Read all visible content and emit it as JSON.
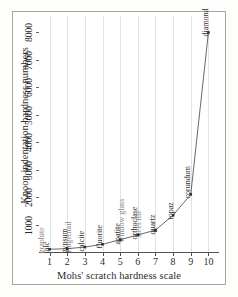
{
  "chart_data": {
    "type": "line",
    "title": "",
    "xlabel": "Mohs' scratch hardness scale",
    "ylabel": "Knoop indentation hardness numbers",
    "xlim": [
      0.4,
      10.6
    ],
    "ylim": [
      0,
      8600
    ],
    "xticks": [
      "1",
      "2",
      "3",
      "4",
      "5",
      "6",
      "7",
      "8",
      "9",
      "10"
    ],
    "yticks": [
      "1000",
      "2000",
      "3000",
      "4000",
      "5000",
      "6000",
      "7000",
      "8000"
    ],
    "grid": "vertical",
    "legend": "none",
    "x": [
      1,
      2,
      3,
      4,
      5,
      6,
      7,
      8,
      9,
      10
    ],
    "values": [
      100,
      120,
      180,
      280,
      450,
      620,
      800,
      1340,
      2100,
      8000
    ],
    "points": [
      {
        "x": 1,
        "y": 100,
        "label": "talc"
      },
      {
        "x": 2,
        "y": 120,
        "label": "gypsum"
      },
      {
        "x": 3,
        "y": 180,
        "label": "calcite"
      },
      {
        "x": 4,
        "y": 280,
        "label": "fluorite"
      },
      {
        "x": 5,
        "y": 450,
        "label": "apatite"
      },
      {
        "x": 6,
        "y": 620,
        "label": "orthoclase"
      },
      {
        "x": 7,
        "y": 800,
        "label": "quartz"
      },
      {
        "x": 8,
        "y": 1340,
        "label": "topaz"
      },
      {
        "x": 9,
        "y": 2100,
        "label": "corundum"
      },
      {
        "x": 10,
        "y": 8000,
        "label": "diamond"
      }
    ],
    "annotations": [
      {
        "label": "graphite",
        "near_x": 1,
        "kind": "reference"
      },
      {
        "label": "fingernail",
        "near_x": 2.5,
        "kind": "reference"
      },
      {
        "label": "window glass",
        "near_x": 5.5,
        "kind": "reference"
      },
      {
        "label": "steel file",
        "near_x": 6.5,
        "kind": "reference"
      }
    ],
    "colors": {
      "line": "#5a5754",
      "marker": "#2f2c2a",
      "grid": "#e2e2e2",
      "axis": "#555150",
      "frame": "#a9a39c",
      "label_primary": "#33302e",
      "label_secondary": "#8d8a86"
    }
  }
}
